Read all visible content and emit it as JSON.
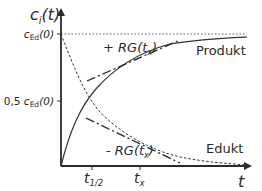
{
  "diagram": {
    "y_axis_label": "c",
    "y_axis_label_sub": "i",
    "y_axis_label_arg": "(t)",
    "x_axis_label": "t",
    "y_ticks": [
      {
        "prefix": "",
        "c": "c",
        "sub": "Ed",
        "arg": "(0)"
      },
      {
        "prefix": "0,5 ",
        "c": "c",
        "sub": "Ed",
        "arg": "(0)"
      }
    ],
    "x_ticks": [
      {
        "t": "t",
        "sub": "1/2"
      },
      {
        "t": "t",
        "sub": "x"
      }
    ],
    "curves": {
      "product": "Produkt",
      "educt": "Edukt"
    },
    "tangents": {
      "plus": {
        "sign": "+ ",
        "text": "RG(t",
        "sub": "x",
        "close": ")"
      },
      "minus": {
        "sign": "- ",
        "text": "RG(t",
        "sub": "x",
        "close": ")"
      }
    },
    "colors": {
      "axis": "#2a2a2a",
      "curve": "#333333"
    }
  }
}
